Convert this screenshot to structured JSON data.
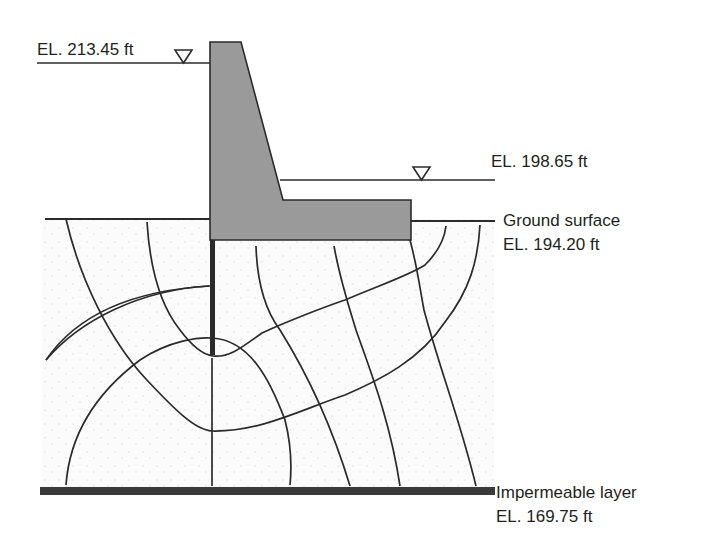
{
  "figure": {
    "type": "flow net under concrete dam with sheet pile",
    "colors": {
      "line": "#2b2b2b",
      "dam_fill": "#9a9a9a",
      "soil_fill": "#fafafa",
      "impermeable": "#3a3a3a"
    }
  },
  "labels": {
    "headwater": "EL. 213.45 ft",
    "tailwater": "EL. 198.65 ft",
    "ground_surface": "Ground surface",
    "ground_elevation": "EL. 194.20 ft",
    "impermeable": "Impermeable layer",
    "impermeable_elevation": "EL. 169.75 ft"
  },
  "icons": {
    "water_level": "inverted-triangle"
  }
}
